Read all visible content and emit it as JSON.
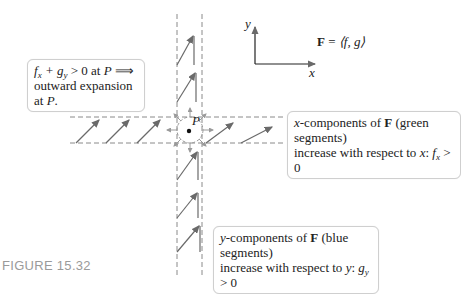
{
  "figure": {
    "caption": "FIGURE 15.32",
    "axes": {
      "x_label": "x",
      "y_label": "y"
    },
    "field_def": {
      "lhs": "F",
      "eq": " = ",
      "rhs": "⟨f, g⟩"
    },
    "point_label": "P",
    "callouts": {
      "divergence": {
        "line1_math": "f",
        "line1_sub1": "x",
        "line1_mid": " + g",
        "line1_sub2": "y",
        "line1_rest": " > 0 at ",
        "line1_p": "P",
        "line1_arrow": " ⟹",
        "line2": "outward expansion",
        "line3_prefix": "at ",
        "line3_p": "P",
        "line3_suffix": "."
      },
      "x_components": {
        "line1_x": "x",
        "line1_rest1": "-components of ",
        "line1_F": "F",
        "line1_rest2": " (green segments)",
        "line2_prefix": "increase with respect to ",
        "line2_var": "x",
        "line2_colon": ": ",
        "line2_f": "f",
        "line2_sub": "x",
        "line2_rest": " > 0"
      },
      "y_components": {
        "line1_y": "y",
        "line1_rest1": "-components of ",
        "line1_F": "F",
        "line1_rest2": " (blue segments)",
        "line2_prefix": "increase with respect to ",
        "line2_var": "y",
        "line2_colon": ": ",
        "line2_g": "g",
        "line2_sub": "y",
        "line2_rest": " > 0"
      }
    },
    "colors": {
      "arrow": "#707070",
      "dashed": "#8a8a8a",
      "circle": "#9a9a9a",
      "caption": "#9a9a9a",
      "box_border": "#cfcfcf"
    }
  }
}
